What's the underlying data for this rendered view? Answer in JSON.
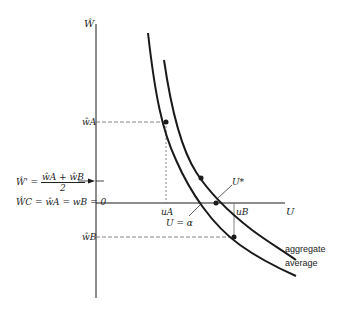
{
  "axes": {
    "y_label": "Ŵ",
    "x_label": "U"
  },
  "labels": {
    "w_a": "ŵA",
    "w_b": "ŵB",
    "w_prime_lhs": "Ŵ' =",
    "w_prime_num": "ŵA + ŵB",
    "w_prime_den": "2",
    "w_c": "ŴC = ŵA = wB = 0",
    "u_a": "uA",
    "u_b": "uB",
    "u_star": "U*",
    "u_alpha": "U = α"
  },
  "legend": {
    "aggregate": "aggregate",
    "average": "average"
  },
  "colors": {
    "line": "#1a1a1a",
    "dashed": "#555555"
  }
}
